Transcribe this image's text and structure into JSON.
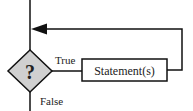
{
  "diagram": {
    "type": "flowchart-while-loop",
    "decision": {
      "symbol": "?",
      "fill": "#d0d0d0"
    },
    "true_label": "True",
    "false_label": "False",
    "statement_label": "Statement(s)",
    "stroke_color": "#111111"
  }
}
